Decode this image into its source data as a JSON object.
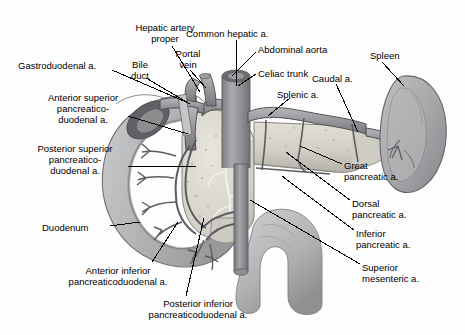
{
  "figure": {
    "background_color": "#fdfdfd",
    "ink_color": "#000000",
    "width": 465,
    "height": 335
  },
  "labels": [
    {
      "id": "hepatic-artery-proper",
      "text": "Hepatic artery\nproper",
      "x": 113,
      "y": 22,
      "align": "c",
      "width": 104
    },
    {
      "id": "common-hepatic-a",
      "text": "Common hepatic a.",
      "x": 186,
      "y": 28,
      "align": "l",
      "width": 112
    },
    {
      "id": "gastroduodenal-a",
      "text": "Gastroduodenal a.",
      "x": 18,
      "y": 60,
      "align": "l",
      "width": 104
    },
    {
      "id": "bile-duct",
      "text": "Bile\nduct",
      "x": 123,
      "y": 59,
      "align": "c",
      "width": 34
    },
    {
      "id": "portal-vein",
      "text": "Portal\nvein",
      "x": 168,
      "y": 48,
      "align": "c",
      "width": 40
    },
    {
      "id": "abdominal-aorta",
      "text": "Abdominal aorta",
      "x": 258,
      "y": 44,
      "align": "l",
      "width": 100
    },
    {
      "id": "spleen",
      "text": "Spleen",
      "x": 370,
      "y": 50,
      "align": "l",
      "width": 46
    },
    {
      "id": "celiac-trunk",
      "text": "Celiac trunk",
      "x": 258,
      "y": 68,
      "align": "l",
      "width": 74
    },
    {
      "id": "caudal-a",
      "text": "Caudal a.",
      "x": 312,
      "y": 73,
      "align": "l",
      "width": 60
    },
    {
      "id": "splenic-a",
      "text": "Splenic a.",
      "x": 277,
      "y": 89,
      "align": "l",
      "width": 62
    },
    {
      "id": "anterior-superior-pancreaticoduodenal-a",
      "text": "Anterior superior\npancreatico-\nduodenal a.",
      "x": 34,
      "y": 92,
      "align": "c",
      "width": 98
    },
    {
      "id": "posterior-superior-pancreaticoduodenal-a",
      "text": "Posterior superior\npancreatico-\nduodenal a.",
      "x": 22,
      "y": 143,
      "align": "c",
      "width": 106
    },
    {
      "id": "great-pancreatic-a",
      "text": "Great\npancreatic a.",
      "x": 344,
      "y": 160,
      "align": "l",
      "width": 76
    },
    {
      "id": "dorsal-pancreatic-a",
      "text": "Dorsal\npancreatic a.",
      "x": 352,
      "y": 198,
      "align": "l",
      "width": 76
    },
    {
      "id": "inferior-pancreatic-a",
      "text": "Inferior\npancreatic a.",
      "x": 356,
      "y": 228,
      "align": "l",
      "width": 76
    },
    {
      "id": "duodenum",
      "text": "Duodenum",
      "x": 42,
      "y": 222,
      "align": "l",
      "width": 66
    },
    {
      "id": "superior-mesenteric-a",
      "text": "Superior\nmesenteric a.",
      "x": 362,
      "y": 262,
      "align": "l",
      "width": 80
    },
    {
      "id": "anterior-inferior-pancreaticoduodenal-a",
      "text": "Anterior inferior\npancreaticoduodenal a.",
      "x": 48,
      "y": 265,
      "align": "c",
      "width": 140
    },
    {
      "id": "posterior-inferior-pancreaticoduodenal-a",
      "text": "Posterior inferior\npancreaticoduodenal a.",
      "x": 128,
      "y": 298,
      "align": "c",
      "width": 140
    }
  ],
  "leader_lines": [
    {
      "id": "leader-hepatic-artery-proper",
      "from": [
        172,
        46
      ],
      "to": [
        200,
        92
      ]
    },
    {
      "id": "leader-common-hepatic-a",
      "from": [
        236,
        40
      ],
      "to": [
        236,
        86
      ]
    },
    {
      "id": "leader-gastroduodenal-a",
      "from": [
        112,
        70
      ],
      "to": [
        186,
        102
      ]
    },
    {
      "id": "leader-bile-duct",
      "from": [
        146,
        78
      ],
      "to": [
        190,
        104
      ]
    },
    {
      "id": "leader-portal-vein",
      "from": [
        190,
        70
      ],
      "to": [
        206,
        88
      ]
    },
    {
      "id": "leader-abdominal-aorta",
      "from": [
        256,
        52
      ],
      "to": [
        232,
        76
      ]
    },
    {
      "id": "leader-spleen",
      "from": [
        382,
        62
      ],
      "to": [
        404,
        86
      ]
    },
    {
      "id": "leader-celiac-trunk",
      "from": [
        256,
        74
      ],
      "to": [
        238,
        86
      ]
    },
    {
      "id": "leader-caudal-a",
      "from": [
        336,
        84
      ],
      "to": [
        358,
        132
      ]
    },
    {
      "id": "leader-splenic-a",
      "from": [
        290,
        98
      ],
      "to": [
        268,
        116
      ]
    },
    {
      "id": "leader-anterior-superior",
      "from": [
        128,
        116
      ],
      "to": [
        188,
        134
      ]
    },
    {
      "id": "leader-posterior-superior",
      "from": [
        128,
        166
      ],
      "to": [
        196,
        166
      ]
    },
    {
      "id": "leader-great-pancreatic-a",
      "from": [
        342,
        164
      ],
      "to": [
        300,
        146
      ]
    },
    {
      "id": "leader-dorsal-pancreatic-a",
      "from": [
        350,
        200
      ],
      "to": [
        286,
        152
      ]
    },
    {
      "id": "leader-inferior-pancreatic-a",
      "from": [
        354,
        230
      ],
      "to": [
        282,
        176
      ]
    },
    {
      "id": "leader-duodenum",
      "from": [
        110,
        226
      ],
      "to": [
        140,
        222
      ]
    },
    {
      "id": "leader-superior-mesenteric-a",
      "from": [
        360,
        264
      ],
      "to": [
        250,
        200
      ]
    },
    {
      "id": "leader-anterior-inferior",
      "from": [
        152,
        262
      ],
      "to": [
        178,
        222
      ]
    },
    {
      "id": "leader-posterior-inferior",
      "from": [
        186,
        296
      ],
      "to": [
        204,
        218
      ]
    }
  ],
  "anatomy": {
    "duodenum": {
      "name": "duodenum",
      "shape": "c-loop",
      "fill": "#b9bbbd"
    },
    "pancreas_head": {
      "name": "pancreas-head",
      "fill": "#d9d6cf"
    },
    "pancreas_body_tail": {
      "name": "pancreas-body-tail",
      "fill": "#d5d2cb"
    },
    "spleen": {
      "name": "spleen",
      "fill": "#a9abad"
    },
    "aorta": {
      "name": "abdominal-aorta",
      "fill": "#8f9194"
    },
    "vessels": {
      "name": "arteries",
      "fill": "#9a9ca0",
      "outline": "#4a4c4f"
    }
  }
}
